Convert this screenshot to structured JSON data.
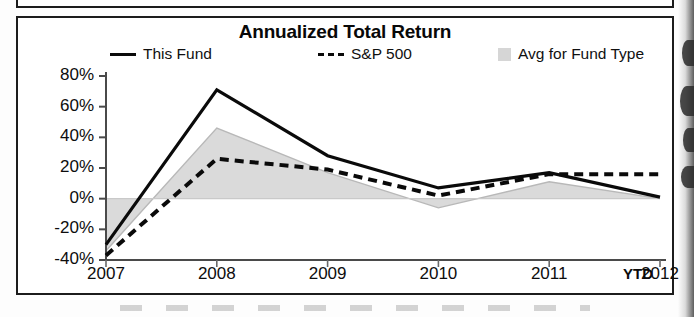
{
  "chart": {
    "title": "Annualized Total Return",
    "ytd_note": "YTD",
    "legend": [
      {
        "label": "This Fund",
        "marker": "solid-line-swatch"
      },
      {
        "label": "S&P 500",
        "marker": "dashed-line-swatch"
      },
      {
        "label": "Avg for Fund Type",
        "marker": "gray-area-swatch"
      }
    ]
  },
  "chart_data": {
    "type": "line",
    "title": "Annualized Total Return",
    "xlabel": "",
    "ylabel": "",
    "x": [
      "2007",
      "2008",
      "2009",
      "2010",
      "2011",
      "2012"
    ],
    "categories": [
      "2007",
      "2008",
      "2009",
      "2010",
      "2011",
      "2012"
    ],
    "ytick_labels": [
      "80%",
      "60%",
      "40%",
      "20%",
      "0%",
      "-20%",
      "-40%"
    ],
    "yticks": [
      80,
      60,
      40,
      20,
      0,
      -20,
      -40
    ],
    "ylim": [
      -40,
      80
    ],
    "grid": false,
    "legend_position": "top",
    "units": "percent",
    "series": [
      {
        "name": "This Fund",
        "style": "solid",
        "color": "#0a0a0a",
        "values": [
          -30,
          71,
          28,
          7,
          17,
          1
        ]
      },
      {
        "name": "S&P 500",
        "style": "dashed",
        "color": "#0a0a0a",
        "values": [
          -37,
          26,
          19,
          2,
          16,
          16
        ]
      },
      {
        "name": "Avg for Fund Type",
        "style": "area",
        "color": "#d8d8d8",
        "values": [
          -34,
          46,
          17,
          -6,
          11,
          0
        ]
      }
    ],
    "annotations": [
      "YTD"
    ]
  },
  "axis": {
    "y": [
      "80%",
      "60%",
      "40%",
      "20%",
      "0%",
      "-20%",
      "-40%"
    ],
    "x": [
      "2007",
      "2008",
      "2009",
      "2010",
      "2011",
      "2012"
    ]
  }
}
